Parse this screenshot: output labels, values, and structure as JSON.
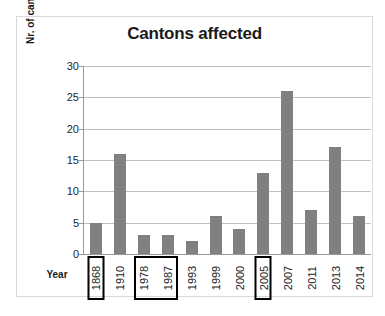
{
  "chart_data": {
    "type": "bar",
    "title": "Cantons affected",
    "xlabel": "Year",
    "ylabel": "Nr. of cantons affected",
    "categories": [
      "1868",
      "1910",
      "1978",
      "1987",
      "1993",
      "1999",
      "2000",
      "2005",
      "2007",
      "2011",
      "2013",
      "2014"
    ],
    "values": [
      5,
      16,
      3,
      3,
      2,
      6,
      4,
      13,
      26,
      7,
      17,
      6
    ],
    "ylim": [
      0,
      30
    ],
    "yticks": [
      0,
      5,
      10,
      15,
      20,
      25,
      30
    ],
    "ytick_labels": [
      "0",
      "5",
      "10",
      "15",
      "20",
      "25",
      "30"
    ],
    "grid": true,
    "legend": "none",
    "bar_color": "#808080",
    "gridline_color": "#bfbfbf",
    "axis_color": "#9a9a9a",
    "frame_color": "#d9d9d9",
    "highlighted_categories": [
      "1868",
      "1978",
      "1987",
      "2005"
    ],
    "highlight_note": "black rectangles drawn around the year labels 1868, the pair 1978-1987, and 2005"
  }
}
